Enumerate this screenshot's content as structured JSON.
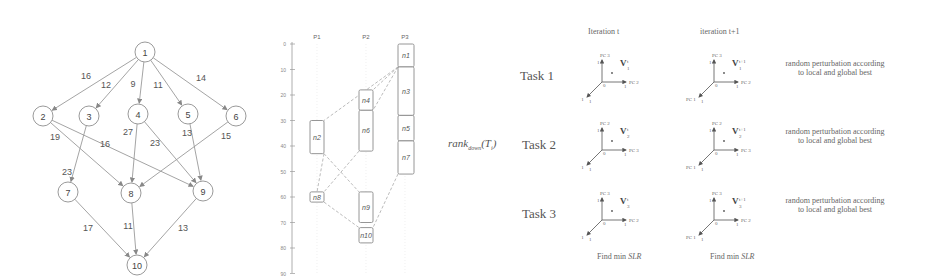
{
  "dag": {
    "nodes": [
      {
        "id": "1",
        "x": 145,
        "y": 52
      },
      {
        "id": "2",
        "x": 43,
        "y": 116
      },
      {
        "id": "3",
        "x": 89,
        "y": 116
      },
      {
        "id": "4",
        "x": 138,
        "y": 114
      },
      {
        "id": "5",
        "x": 188,
        "y": 114
      },
      {
        "id": "6",
        "x": 236,
        "y": 116
      },
      {
        "id": "7",
        "x": 68,
        "y": 192
      },
      {
        "id": "8",
        "x": 131,
        "y": 193
      },
      {
        "id": "9",
        "x": 203,
        "y": 191
      },
      {
        "id": "10",
        "x": 137,
        "y": 265
      }
    ],
    "edges": [
      {
        "from": "1",
        "to": "2",
        "weight": "16",
        "lx": 86,
        "ly": 79
      },
      {
        "from": "1",
        "to": "3",
        "weight": "12",
        "lx": 106,
        "ly": 88
      },
      {
        "from": "1",
        "to": "4",
        "weight": "9",
        "lx": 133,
        "ly": 87
      },
      {
        "from": "1",
        "to": "5",
        "weight": "11",
        "lx": 158,
        "ly": 88
      },
      {
        "from": "1",
        "to": "6",
        "weight": "14",
        "lx": 201,
        "ly": 81
      },
      {
        "from": "2",
        "to": "8",
        "weight": "19",
        "lx": 55,
        "ly": 140
      },
      {
        "from": "2",
        "to": "9",
        "weight": "16",
        "lx": 105,
        "ly": 147
      },
      {
        "from": "3",
        "to": "7",
        "weight": "23",
        "lx": 67,
        "ly": 175
      },
      {
        "from": "4",
        "to": "8",
        "weight": "27",
        "lx": 128,
        "ly": 135
      },
      {
        "from": "4",
        "to": "9",
        "weight": "23",
        "lx": 155,
        "ly": 146
      },
      {
        "from": "5",
        "to": "9",
        "weight": "13",
        "lx": 187,
        "ly": 136
      },
      {
        "from": "6",
        "to": "8",
        "weight": "15",
        "lx": 226,
        "ly": 139
      },
      {
        "from": "7",
        "to": "10",
        "weight": "17",
        "lx": 88,
        "ly": 231
      },
      {
        "from": "8",
        "to": "10",
        "weight": "11",
        "lx": 128,
        "ly": 229
      },
      {
        "from": "9",
        "to": "10",
        "weight": "13",
        "lx": 183,
        "ly": 231
      }
    ]
  },
  "gantt": {
    "processors": [
      "P1",
      "P2",
      "P3"
    ],
    "ticks": [
      "0",
      "10",
      "20",
      "30",
      "40",
      "50",
      "60",
      "70",
      "80",
      "90"
    ],
    "tasks": [
      {
        "label": "n1",
        "proc": 2,
        "start": 0,
        "end": 9
      },
      {
        "label": "n3",
        "proc": 2,
        "start": 9,
        "end": 28
      },
      {
        "label": "n5",
        "proc": 2,
        "start": 28,
        "end": 38
      },
      {
        "label": "n7",
        "proc": 2,
        "start": 38,
        "end": 51
      },
      {
        "label": "n4",
        "proc": 1,
        "start": 18,
        "end": 26
      },
      {
        "label": "n6",
        "proc": 1,
        "start": 26,
        "end": 42
      },
      {
        "label": "n2",
        "proc": 0,
        "start": 30,
        "end": 43
      },
      {
        "label": "n8",
        "proc": 0,
        "start": 58,
        "end": 62
      },
      {
        "label": "n9",
        "proc": 1,
        "start": 58,
        "end": 70
      },
      {
        "label": "n10",
        "proc": 1,
        "start": 72,
        "end": 78
      }
    ]
  },
  "rank_label": "rank",
  "rank_sub": "down",
  "rank_arg": "(T",
  "rank_arg_sub": "i",
  "rank_close": ")",
  "pso": {
    "iteration_t": "Iteration  t",
    "iteration_t1": "iteration  t+1",
    "tasks": [
      {
        "label": "Task 1",
        "vec_t": "V",
        "vec_t_sup": "t",
        "vec_t_sub": "1",
        "vec_t1_sup": "t+1",
        "vec_t1_sub": "1",
        "axes_top": "PC 3",
        "axes_right": "PC 2",
        "axes_left": "PC 1"
      },
      {
        "label": "Task 2",
        "vec_t": "V",
        "vec_t_sup": "t",
        "vec_t_sub": "2",
        "vec_t1_sup": "t+1",
        "vec_t1_sub": "2",
        "axes_top": "PC 2",
        "axes_right": "PC 3",
        "axes_left": "PC 1"
      },
      {
        "label": "Task 3",
        "vec_t": "V",
        "vec_t_sup": "t",
        "vec_t_sub": "3",
        "vec_t1_sup": "t+1",
        "vec_t1_sub": "3",
        "axes_top": "PC 3",
        "axes_right": "PC 2",
        "axes_left": "PC 1"
      }
    ],
    "perturb_line1": "random perturbation according",
    "perturb_line2": "to local and global best",
    "find_min": "Find min",
    "slr": "SLR",
    "axis_one": "1",
    "axis_zero": "0"
  }
}
